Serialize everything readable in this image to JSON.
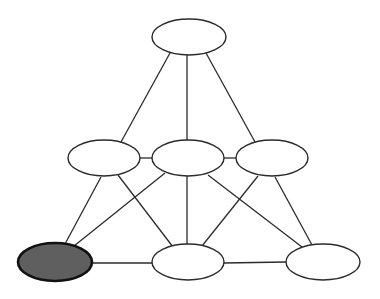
{
  "diagram": {
    "type": "graph",
    "colors": {
      "background": "#ffffff",
      "stroke": "#2b2b2b",
      "node_fill": "#ffffff",
      "highlight_fill": "#5f5f5f",
      "highlight_stroke": "#111111"
    },
    "nodes": [
      {
        "id": "top",
        "cx": 189,
        "cy": 37,
        "rx": 37,
        "ry": 18,
        "highlighted": false
      },
      {
        "id": "mid-left",
        "cx": 104,
        "cy": 158,
        "rx": 36,
        "ry": 18,
        "highlighted": false
      },
      {
        "id": "mid-center",
        "cx": 188,
        "cy": 158,
        "rx": 36,
        "ry": 18,
        "highlighted": false
      },
      {
        "id": "mid-right",
        "cx": 272,
        "cy": 158,
        "rx": 36,
        "ry": 18,
        "highlighted": false
      },
      {
        "id": "bottom-left",
        "cx": 55,
        "cy": 262,
        "rx": 37,
        "ry": 19,
        "highlighted": true
      },
      {
        "id": "bottom-center",
        "cx": 188,
        "cy": 262,
        "rx": 36,
        "ry": 18,
        "highlighted": false
      },
      {
        "id": "bottom-right",
        "cx": 323,
        "cy": 262,
        "rx": 37,
        "ry": 18,
        "highlighted": false
      }
    ],
    "edges": [
      {
        "from": "top",
        "to": "mid-left",
        "x1": 170,
        "y1": 53,
        "x2": 121,
        "y2": 142
      },
      {
        "from": "top",
        "to": "mid-center",
        "x1": 187,
        "y1": 55,
        "x2": 187,
        "y2": 140
      },
      {
        "from": "top",
        "to": "mid-right",
        "x1": 206,
        "y1": 53,
        "x2": 255,
        "y2": 142
      },
      {
        "from": "mid-left",
        "to": "mid-center",
        "x1": 140,
        "y1": 158,
        "x2": 152,
        "y2": 158
      },
      {
        "from": "mid-center",
        "to": "mid-right",
        "x1": 224,
        "y1": 158,
        "x2": 236,
        "y2": 158
      },
      {
        "from": "mid-left",
        "to": "bottom-left",
        "x1": 101,
        "y1": 177,
        "x2": 65,
        "y2": 244
      },
      {
        "from": "mid-left",
        "to": "bottom-center",
        "x1": 118,
        "y1": 175,
        "x2": 173,
        "y2": 247
      },
      {
        "from": "mid-center",
        "to": "bottom-left",
        "x1": 165,
        "y1": 173,
        "x2": 74,
        "y2": 246
      },
      {
        "from": "mid-center",
        "to": "bottom-center",
        "x1": 187,
        "y1": 176,
        "x2": 187,
        "y2": 244
      },
      {
        "from": "mid-center",
        "to": "bottom-right",
        "x1": 208,
        "y1": 175,
        "x2": 302,
        "y2": 247
      },
      {
        "from": "mid-right",
        "to": "bottom-center",
        "x1": 258,
        "y1": 176,
        "x2": 202,
        "y2": 246
      },
      {
        "from": "mid-right",
        "to": "bottom-right",
        "x1": 275,
        "y1": 177,
        "x2": 312,
        "y2": 245
      },
      {
        "from": "bottom-left",
        "to": "bottom-center",
        "x1": 92,
        "y1": 263,
        "x2": 152,
        "y2": 263
      },
      {
        "from": "bottom-center",
        "to": "bottom-right",
        "x1": 224,
        "y1": 263,
        "x2": 286,
        "y2": 262
      }
    ]
  }
}
